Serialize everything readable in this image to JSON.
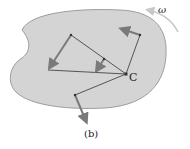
{
  "figure": {
    "caption": "(b)",
    "center_label": "C",
    "angular_velocity_label": "ω"
  },
  "colors": {
    "body_fill": "#d4d4d4",
    "body_stroke": "#8a8a8a",
    "line": "#333333",
    "arrow": "#7a7a7a",
    "omega_arrow": "#c8c8c8"
  }
}
